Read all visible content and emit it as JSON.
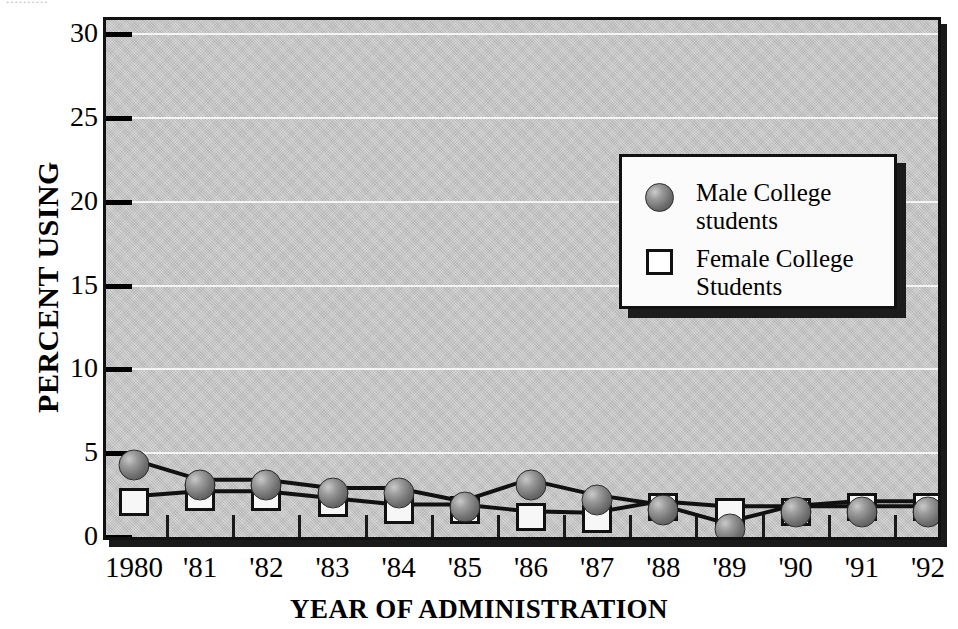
{
  "figure": {
    "top_clipped_caption": "..........",
    "plot_background": "#c8c8c8",
    "frame_color": "#111111",
    "gridline_color": "#f4f4f4"
  },
  "axes": {
    "ylabel": "PERCENT USING",
    "xlabel": "YEAR OF ADMINISTRATION",
    "yticks": [
      "0",
      "5",
      "10",
      "15",
      "20",
      "25",
      "30"
    ],
    "xticks": [
      "1980",
      "'81",
      "'82",
      "'83",
      "'84",
      "'85",
      "'86",
      "'87",
      "'88",
      "'89",
      "'90",
      "'91",
      "'92"
    ]
  },
  "legend": {
    "position": "upper-right-inside",
    "entries": [
      {
        "marker": "filled-circle-icon",
        "line1": "Male College",
        "line2": "students"
      },
      {
        "marker": "open-square-icon",
        "line1": "Female College",
        "line2": "Students"
      }
    ]
  },
  "chart_data": {
    "type": "line",
    "title": "",
    "subtitle": "",
    "xlabel": "YEAR OF ADMINISTRATION",
    "ylabel": "PERCENT USING",
    "categories": [
      "1980",
      "'81",
      "'82",
      "'83",
      "'84",
      "'85",
      "'86",
      "'87",
      "'88",
      "'89",
      "'90",
      "'91",
      "'92"
    ],
    "x_full_years": [
      1980,
      1981,
      1982,
      1983,
      1984,
      1985,
      1986,
      1987,
      1988,
      1989,
      1990,
      1991,
      1992
    ],
    "ylim": [
      0,
      30
    ],
    "xlim_categories": [
      0,
      12
    ],
    "ytick_step": 5,
    "grid": true,
    "grid_axis": "y",
    "legend_position": "upper right (inside axes)",
    "series": [
      {
        "name": "Male College students",
        "marker": "filled-circle",
        "marker_color": "#6e6e6e",
        "line_color": "#111111",
        "values": [
          4.3,
          3.1,
          3.1,
          2.6,
          2.6,
          1.8,
          3.1,
          2.2,
          1.6,
          0.5,
          1.5,
          1.5,
          1.5
        ]
      },
      {
        "name": "Female College Students",
        "marker": "open-square",
        "marker_color": "#ffffff",
        "line_color": "#111111",
        "values": [
          2.1,
          2.4,
          2.4,
          2.0,
          1.6,
          1.6,
          1.2,
          1.1,
          1.8,
          1.5,
          1.5,
          1.8,
          1.8
        ]
      }
    ]
  }
}
